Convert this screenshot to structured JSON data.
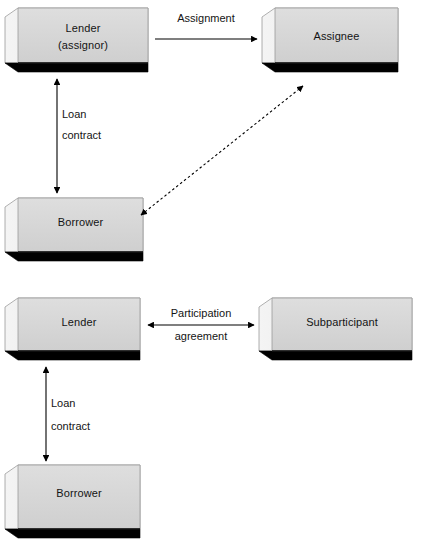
{
  "diagram": {
    "background_color": "#ffffff",
    "box_face_color": "#d4d4d4",
    "box_side_color": "#e8e8e8",
    "box_shadow_color": "#000000",
    "box_outline_color": "#808080",
    "line_color": "#000000",
    "sections": [
      {
        "name": "assignment-structure",
        "nodes": [
          {
            "id": "lender-assignor",
            "label_line1": "Lender",
            "label_line2": "(assignor)"
          },
          {
            "id": "assignee",
            "label_line1": "Assignee",
            "label_line2": ""
          },
          {
            "id": "borrower-top",
            "label_line1": "Borrower",
            "label_line2": ""
          }
        ],
        "edges": [
          {
            "id": "assignment-edge",
            "label_line1": "Assignment",
            "label_line2": "",
            "style": "solid",
            "arrows": "single",
            "from": "lender-assignor",
            "to": "assignee"
          },
          {
            "id": "loan-contract-edge-top",
            "label_line1": "Loan",
            "label_line2": "contract",
            "style": "solid",
            "arrows": "double",
            "from": "lender-assignor",
            "to": "borrower-top"
          },
          {
            "id": "borrower-assignee-edge",
            "label_line1": "",
            "label_line2": "",
            "style": "dashed",
            "arrows": "double",
            "from": "borrower-top",
            "to": "assignee"
          }
        ]
      },
      {
        "name": "participation-structure",
        "nodes": [
          {
            "id": "lender-bottom",
            "label_line1": "Lender",
            "label_line2": ""
          },
          {
            "id": "subparticipant",
            "label_line1": "Subparticipant",
            "label_line2": ""
          },
          {
            "id": "borrower-bottom",
            "label_line1": "Borrower",
            "label_line2": ""
          }
        ],
        "edges": [
          {
            "id": "participation-edge",
            "label_line1": "Participation",
            "label_line2": "agreement",
            "style": "solid",
            "arrows": "double",
            "from": "lender-bottom",
            "to": "subparticipant"
          },
          {
            "id": "loan-contract-edge-bottom",
            "label_line1": "Loan",
            "label_line2": "contract",
            "style": "solid",
            "arrows": "double",
            "from": "lender-bottom",
            "to": "borrower-bottom"
          }
        ]
      }
    ]
  }
}
